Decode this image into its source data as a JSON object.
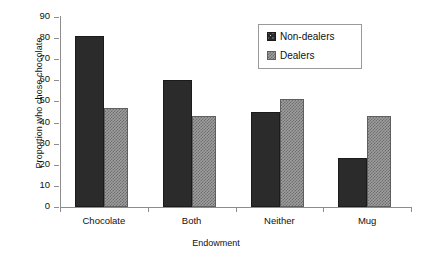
{
  "chart_data": {
    "type": "bar",
    "title": "",
    "xlabel": "Endowment",
    "ylabel": "Proportion who chose chocolate",
    "categories": [
      "Chocolate",
      "Both",
      "Neither",
      "Mug"
    ],
    "series": [
      {
        "name": "Non-dealers",
        "values": [
          81,
          60,
          45,
          23
        ],
        "color": "#2b2b2b",
        "pattern": "dark-dotted"
      },
      {
        "name": "Dealers",
        "values": [
          47,
          43,
          51,
          43
        ],
        "color": "#9e9e9e",
        "pattern": "gray-checkered"
      }
    ],
    "ylim": [
      0,
      90
    ],
    "yticks": [
      0,
      10,
      20,
      30,
      40,
      50,
      60,
      70,
      80,
      90
    ],
    "ytick_labels": [
      "0",
      "10",
      "20",
      "30",
      "40",
      "50",
      "60",
      "70",
      "80",
      "90"
    ],
    "grid": false,
    "legend_position": "top-right",
    "legend_entries": [
      "Non-dealers",
      "Dealers"
    ]
  }
}
